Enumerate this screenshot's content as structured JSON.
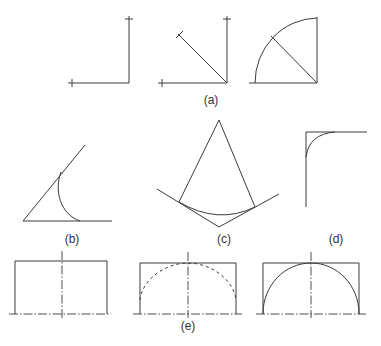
{
  "labels": {
    "a": "(a)",
    "b": "(b)",
    "c": "(c)",
    "d": "(d)",
    "e": "(e)"
  },
  "colors": {
    "background": "#ffffff",
    "line": "#3a3a3a"
  },
  "figures": [
    {
      "id": "a",
      "description": "Three-step construction of a quarter circle: right angle with tick marks, bisector with X mark, quarter arc"
    },
    {
      "id": "b",
      "description": "Curve tangent to two lines meeting at an acute angle"
    },
    {
      "id": "c",
      "description": "Arc tangent to two lines forming an obtuse angle, with radii from apex"
    },
    {
      "id": "d",
      "description": "Rounded corner (fillet) of a right angle"
    },
    {
      "id": "e",
      "description": "Three-step construction of a semicircular arch inside a rectangle with centerlines"
    }
  ]
}
